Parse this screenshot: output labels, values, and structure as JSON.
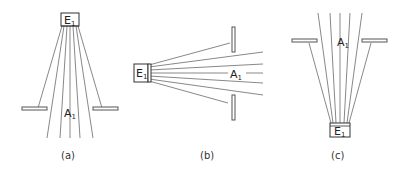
{
  "figure": {
    "panels": [
      {
        "id": "a",
        "caption": "(a)",
        "emitter": "E",
        "emitter_sub": "1",
        "aperture": "A",
        "aperture_sub": "1",
        "orientation": "emitter-top"
      },
      {
        "id": "b",
        "caption": "(b)",
        "emitter": "E",
        "emitter_sub": "1",
        "aperture": "A",
        "aperture_sub": "1",
        "orientation": "emitter-left"
      },
      {
        "id": "c",
        "caption": "(c)",
        "emitter": "E",
        "emitter_sub": "1",
        "aperture": "A",
        "aperture_sub": "1",
        "orientation": "emitter-bottom"
      }
    ]
  }
}
